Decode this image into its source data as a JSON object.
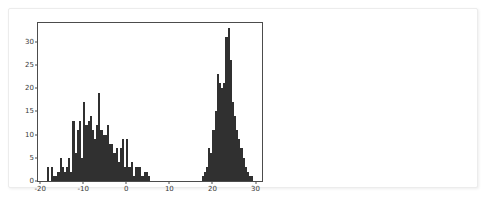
{
  "card": {
    "background_color": "#ffffff",
    "border_color": "#ececec"
  },
  "chart_data": {
    "type": "bar",
    "subtype": "histogram",
    "title": "",
    "subtitle": "",
    "xlabel": "",
    "ylabel": "",
    "xlim": [
      -20.5,
      31.5
    ],
    "ylim": [
      0,
      34
    ],
    "grid": false,
    "legend": null,
    "bar_color": "#303030",
    "axes_color": "#4c4c4c",
    "bin_width": 0.5,
    "xticks": [
      -20,
      -10,
      0,
      10,
      20,
      30
    ],
    "xtick_labels": [
      "-20",
      "-10",
      "0",
      "10",
      "20",
      "30"
    ],
    "yticks": [
      0,
      5,
      10,
      15,
      20,
      25,
      30
    ],
    "ytick_labels": [
      "0",
      "5",
      "10",
      "15",
      "20",
      "25",
      "30"
    ],
    "bin_starts": [
      -18.5,
      -18.0,
      -17.5,
      -17.0,
      -16.5,
      -16.0,
      -15.5,
      -15.0,
      -14.5,
      -14.0,
      -13.5,
      -13.0,
      -12.5,
      -12.0,
      -11.5,
      -11.0,
      -10.5,
      -10.0,
      -9.5,
      -9.0,
      -8.5,
      -8.0,
      -7.5,
      -7.0,
      -6.5,
      -6.0,
      -5.5,
      -5.0,
      -4.5,
      -4.0,
      -3.5,
      -3.0,
      -2.5,
      -2.0,
      -1.5,
      -1.0,
      -0.5,
      0.0,
      0.5,
      1.0,
      1.5,
      2.0,
      2.5,
      3.0,
      3.5,
      4.0,
      4.5,
      5.0,
      17.5,
      18.0,
      18.5,
      19.0,
      19.5,
      20.0,
      20.5,
      21.0,
      21.5,
      22.0,
      22.5,
      23.0,
      23.5,
      24.0,
      24.5,
      25.0,
      25.5,
      26.0,
      26.5,
      27.0,
      27.5,
      28.0,
      28.5,
      29.0
    ],
    "counts": [
      3,
      0,
      3,
      1,
      1,
      2,
      5,
      3,
      2,
      3,
      5,
      2,
      13,
      6,
      11,
      13,
      5,
      17,
      12,
      13,
      14,
      11,
      9,
      12,
      19,
      11,
      10,
      10,
      12,
      8,
      8,
      6,
      7,
      4,
      7,
      9,
      3,
      9,
      3,
      4,
      1,
      3,
      3,
      3,
      1,
      2,
      2,
      1,
      1,
      2,
      3,
      7,
      6,
      11,
      15,
      23,
      21,
      20,
      21,
      31,
      33,
      26,
      17,
      14,
      11,
      9,
      7,
      5,
      3,
      2,
      1,
      1
    ]
  },
  "axis": {
    "spine_top": "visible",
    "spine_right": "visible",
    "spine_bottom": "visible",
    "spine_left": "visible"
  }
}
